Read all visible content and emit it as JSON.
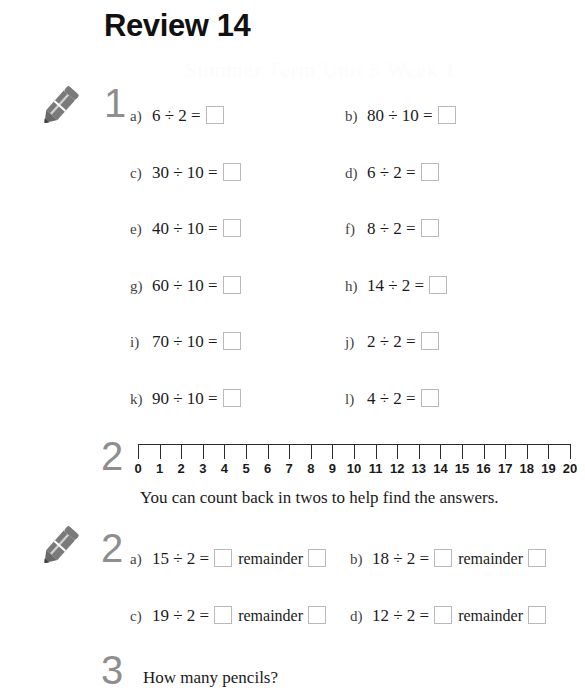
{
  "page": {
    "title": "Review 14",
    "ghost_text": "Summer Term Unit 5 Week 1"
  },
  "icons": {
    "pencil": "pencil-icon"
  },
  "sections": [
    {
      "number": "1",
      "has_pencil": true,
      "items": [
        {
          "label": "a)",
          "expr": "6 ÷ 2 =",
          "col": "left",
          "row": 0
        },
        {
          "label": "b)",
          "expr": "80 ÷ 10 =",
          "col": "right",
          "row": 0
        },
        {
          "label": "c)",
          "expr": "30 ÷ 10 =",
          "col": "left",
          "row": 1
        },
        {
          "label": "d)",
          "expr": "6 ÷ 2 =",
          "col": "right",
          "row": 1
        },
        {
          "label": "e)",
          "expr": "40 ÷ 10 =",
          "col": "left",
          "row": 2
        },
        {
          "label": "f)",
          "expr": "8 ÷ 2 =",
          "col": "right",
          "row": 2
        },
        {
          "label": "g)",
          "expr": "60 ÷ 10 =",
          "col": "left",
          "row": 3
        },
        {
          "label": "h)",
          "expr": "14 ÷ 2 =",
          "col": "right",
          "row": 3
        },
        {
          "label": "i)",
          "expr": "70 ÷ 10 =",
          "col": "left",
          "row": 4
        },
        {
          "label": "j)",
          "expr": "2 ÷ 2 =",
          "col": "right",
          "row": 4
        },
        {
          "label": "k)",
          "expr": "90 ÷ 10 =",
          "col": "left",
          "row": 5
        },
        {
          "label": "l)",
          "expr": "4 ÷ 2 =",
          "col": "right",
          "row": 5
        }
      ]
    },
    {
      "number": "2",
      "has_pencil": true,
      "remainder_word": "remainder",
      "hint": "You can count back in twos to help find the answers.",
      "items": [
        {
          "label": "a)",
          "expr": "15 ÷ 2 =",
          "col": "left",
          "row": 0
        },
        {
          "label": "b)",
          "expr": "18 ÷ 2 =",
          "col": "right",
          "row": 0
        },
        {
          "label": "c)",
          "expr": "19 ÷ 2 =",
          "col": "left",
          "row": 1
        },
        {
          "label": "d)",
          "expr": "12 ÷ 2 =",
          "col": "right",
          "row": 1
        }
      ]
    },
    {
      "number": "3",
      "has_pencil": false,
      "prompt": "How many pencils?"
    }
  ],
  "number_line": {
    "min": 0,
    "max": 20,
    "ticks": [
      "0",
      "1",
      "2",
      "3",
      "4",
      "5",
      "6",
      "7",
      "8",
      "9",
      "10",
      "11",
      "12",
      "13",
      "14",
      "15",
      "16",
      "17",
      "18",
      "19",
      "20"
    ]
  },
  "colors": {
    "text": "#1a1a1a",
    "numeral_gray": "#8e8e8e",
    "box_border": "#b9b9b9",
    "pencil_body": "#6e6e6e",
    "pencil_tip": "#3c3c3c"
  }
}
